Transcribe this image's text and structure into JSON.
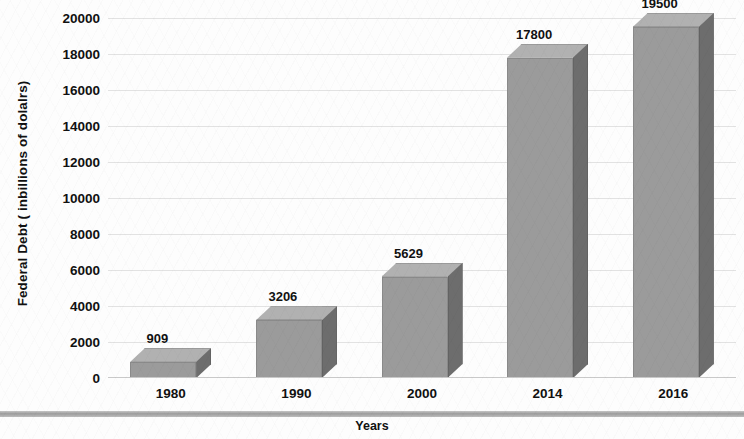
{
  "chart_data": {
    "type": "bar",
    "title": "",
    "subtitle": "",
    "xlabel": "Years",
    "ylabel": "Federal Debt ( inbillions of dolalrs)",
    "categories": [
      "1980",
      "1990",
      "2000",
      "2014",
      "2016"
    ],
    "values": [
      909,
      3206,
      5629,
      17800,
      19500
    ],
    "value_labels": [
      "909",
      "3206",
      "5629",
      "17800",
      "19500"
    ],
    "ylim": [
      0,
      20000
    ],
    "y_ticks": [
      20000,
      18000,
      16000,
      14000,
      12000,
      10000,
      8000,
      6000,
      4000,
      2000,
      0
    ],
    "y_tick_labels": [
      "20000",
      "18000",
      "16000",
      "14000",
      "12000",
      "10000",
      "8000",
      "6000",
      "4000",
      "2000",
      "0"
    ],
    "grid": true,
    "legend": false,
    "legend_position": "none",
    "style": "3d-column",
    "series": [
      {
        "name": "Federal Debt",
        "values": [
          909,
          3206,
          5629,
          17800,
          19500
        ]
      }
    ],
    "colors": {
      "bar_front": "#9b9b9b",
      "bar_side": "#6d6d6d",
      "bar_top": "#b1b1b1",
      "gridline": "#e2e2e2",
      "text": "#111111",
      "background": "#fdfdfd",
      "axis_band": "#9d9d9d"
    }
  }
}
